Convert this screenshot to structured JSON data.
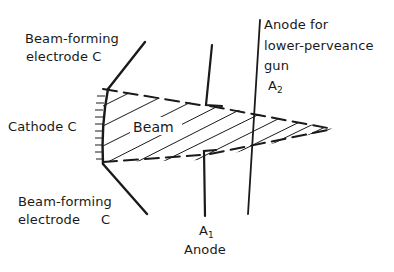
{
  "diagram": {
    "title": "",
    "labels": {
      "beam_forming_top_line1": "Beam-forming",
      "beam_forming_top_line2": "electrode C",
      "cathode": "Cathode C",
      "beam": "Beam",
      "beam_forming_bottom_line1": "Beam-forming",
      "beam_forming_bottom_line2": "electrode",
      "beam_forming_bottom_c": "C",
      "anode_a1_symbol": "A",
      "anode_a1_subscript": "1",
      "anode_a1_name": "Anode",
      "anode_a2_line1": "Anode for",
      "anode_a2_line2": "lower-perveance",
      "anode_a2_line3": "gun",
      "anode_a2_symbol": "A",
      "anode_a2_subscript": "2"
    },
    "elements": [
      {
        "id": "cathode",
        "type": "curved-emitter-with-ticks"
      },
      {
        "id": "beam-forming-electrode-top",
        "type": "line"
      },
      {
        "id": "beam-forming-electrode-bottom",
        "type": "line"
      },
      {
        "id": "electron-beam",
        "type": "hatched-converging-beam"
      },
      {
        "id": "anode-a1",
        "type": "split-plate-with-aperture"
      },
      {
        "id": "anode-a2",
        "type": "line"
      }
    ],
    "colors": {
      "ink": "#1a1a1a",
      "background": "#ffffff"
    }
  }
}
